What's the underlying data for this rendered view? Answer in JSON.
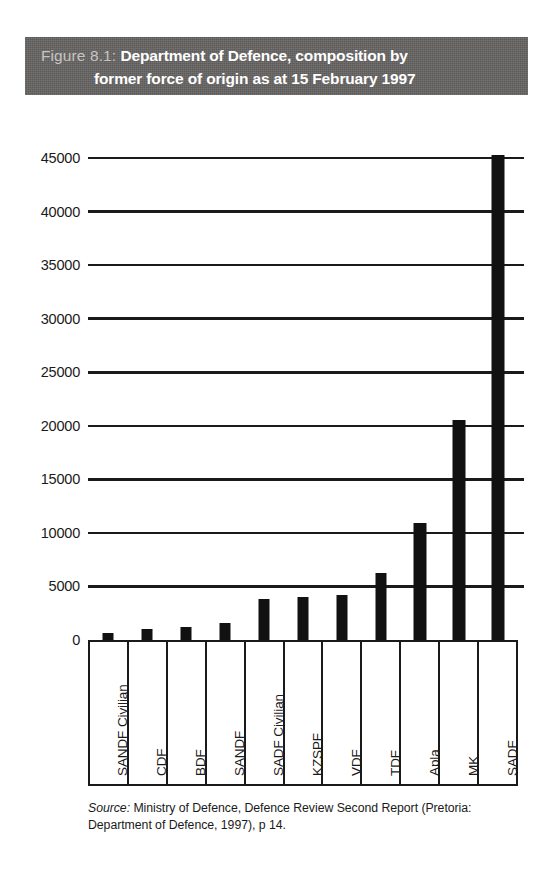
{
  "figure": {
    "number": "Figure 8.1:",
    "title_line1": "Department of Defence, composition by",
    "title_line2": "former force of origin as at 15 February 1997",
    "banner_color": "#666463",
    "number_color": "#c7c4c2",
    "title_color": "#ffffff"
  },
  "source": {
    "label": "Source:",
    "text": " Ministry of Defence, Defence Review Second Report (Pretoria: Department of Defence, 1997), p 14."
  },
  "chart_data": {
    "type": "bar",
    "title": "Department of Defence, composition by former force of origin as at 15 February 1997",
    "xlabel": "",
    "ylabel": "",
    "ylim": [
      0,
      47000
    ],
    "yticks": [
      0,
      5000,
      10000,
      15000,
      20000,
      25000,
      30000,
      35000,
      40000,
      45000
    ],
    "ytick_labels": [
      "0",
      "5000",
      "10000",
      "15000",
      "20000",
      "25000",
      "30000",
      "35000",
      "40000",
      "45000"
    ],
    "grid": true,
    "grid_axis": "y",
    "legend": "none",
    "bar_color": "#111111",
    "categories": [
      "SANDF Civilian",
      "CDF",
      "BDF",
      "SANDF",
      "SADF Civilian",
      "KZSPF",
      "VDF",
      "TDF",
      "Apla",
      "MK",
      "SADF"
    ],
    "values": [
      700,
      1000,
      1250,
      1550,
      3800,
      4000,
      4200,
      6300,
      10900,
      20500,
      45300
    ]
  }
}
